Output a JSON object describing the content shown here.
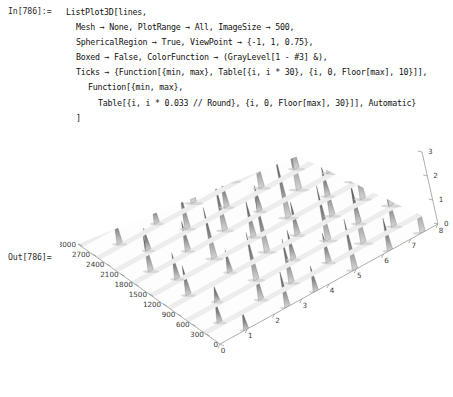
{
  "notebook": {
    "in_label": "In[786]:=",
    "out_label": "Out[786]=",
    "code_lines": [
      "ListPlot3D[lines,",
      "Mesh → None, PlotRange → All, ImageSize → 500,",
      "SphericalRegion → True, ViewPoint → {-1, 1, 0.75},",
      "Boxed → False, ColorFunction → (GrayLevel[1 - #3] &),",
      "Ticks → {Function[{min, max}, Table[{i, i * 30}, {i, 0, Floor[max], 10}]],",
      "Function[{min, max},",
      "Table[{i, i * 0.033 // Round}, {i, 0, Floor[max], 30}]], Automatic}",
      "]"
    ]
  },
  "chart_data": {
    "type": "surface3d",
    "title": "",
    "plot_function": "ListPlot3D",
    "color_scheme": "grayscale",
    "render_style": "mesh-none-grayscale-surface",
    "axes": {
      "left": {
        "name": "time-axis",
        "label": "",
        "ticks": [
          3000,
          2700,
          2400,
          2100,
          1800,
          1500,
          1200,
          900,
          600,
          300,
          0
        ],
        "tick_step": 300,
        "range": [
          0,
          3000
        ]
      },
      "right": {
        "name": "index-axis",
        "label": "",
        "ticks": [
          8,
          7,
          6,
          5,
          4,
          3,
          2,
          1,
          0
        ],
        "tick_step": 1,
        "range": [
          0,
          8
        ]
      },
      "vertical": {
        "name": "value-axis",
        "label": "",
        "ticks": [
          0,
          1,
          2,
          3
        ],
        "tick_step": 1,
        "range": [
          0,
          3
        ]
      }
    },
    "surface": {
      "rows": 9,
      "description": "nine parallel ridge lines of sharp spikes on a flat grayscale plane",
      "spike_peaks": [
        {
          "row": 0,
          "positions": [
            0.12,
            0.31,
            0.44,
            0.62,
            0.78,
            0.93
          ],
          "heights": [
            0.25,
            0.5,
            0.35,
            0.7,
            0.45,
            0.9
          ]
        },
        {
          "row": 1,
          "positions": [
            0.08,
            0.27,
            0.41,
            0.58,
            0.74,
            0.88
          ],
          "heights": [
            0.3,
            0.45,
            0.6,
            0.4,
            0.85,
            0.55
          ]
        },
        {
          "row": 2,
          "positions": [
            0.15,
            0.33,
            0.5,
            0.66,
            0.8,
            0.95
          ],
          "heights": [
            0.2,
            0.65,
            0.4,
            0.75,
            0.5,
            0.95
          ]
        },
        {
          "row": 3,
          "positions": [
            0.1,
            0.29,
            0.46,
            0.6,
            0.76,
            0.9
          ],
          "heights": [
            0.4,
            0.3,
            0.8,
            0.45,
            0.6,
            0.7
          ]
        },
        {
          "row": 4,
          "positions": [
            0.13,
            0.3,
            0.48,
            0.64,
            0.82,
            0.94
          ],
          "heights": [
            0.35,
            0.7,
            0.5,
            0.9,
            0.4,
            0.8
          ]
        },
        {
          "row": 5,
          "positions": [
            0.09,
            0.26,
            0.43,
            0.59,
            0.77,
            0.91
          ],
          "heights": [
            0.5,
            0.4,
            0.65,
            0.35,
            0.95,
            0.6
          ]
        },
        {
          "row": 6,
          "positions": [
            0.16,
            0.34,
            0.52,
            0.68,
            0.84,
            0.96
          ],
          "heights": [
            0.3,
            0.55,
            0.45,
            0.7,
            0.6,
            1.0
          ]
        },
        {
          "row": 7,
          "positions": [
            0.11,
            0.28,
            0.45,
            0.63,
            0.79,
            0.92
          ],
          "heights": [
            0.45,
            0.35,
            0.75,
            0.5,
            0.85,
            0.65
          ]
        },
        {
          "row": 8,
          "positions": [
            0.14,
            0.32,
            0.49,
            0.65,
            0.81,
            0.97
          ],
          "heights": [
            0.25,
            0.6,
            0.4,
            0.8,
            0.55,
            0.9
          ]
        }
      ]
    }
  }
}
